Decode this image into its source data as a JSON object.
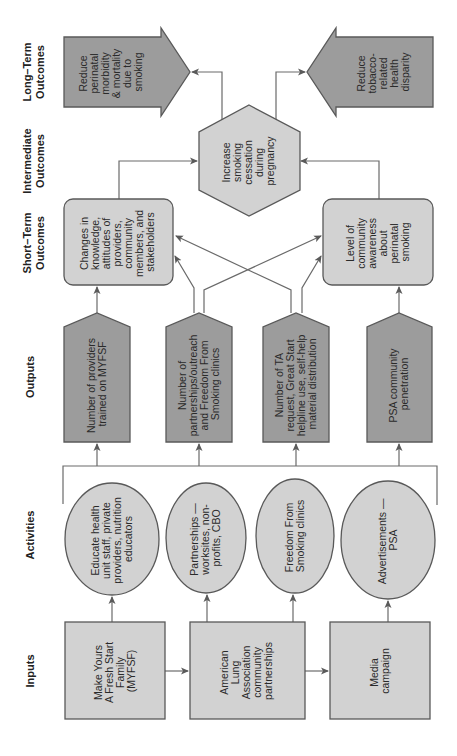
{
  "columns": {
    "long_term": [
      "Long–Term",
      "Outcomes"
    ],
    "intermediate": [
      "Intermediate",
      "Outcomes"
    ],
    "short_term": [
      "Short–Term",
      "Outcomes"
    ],
    "outputs": [
      "Outputs"
    ],
    "activities": [
      "Activities"
    ],
    "inputs": [
      "Inputs"
    ]
  },
  "long_term_outcomes": [
    {
      "lines": [
        "Reduce",
        "perinatal",
        "morbidity",
        "& mortality",
        "due to",
        "smoking"
      ]
    },
    {
      "lines": [
        "Reduce",
        "tobacco-",
        "related",
        "health",
        "disparity"
      ]
    }
  ],
  "intermediate_outcome": {
    "lines": [
      "Increase",
      "smoking",
      "cessation",
      "during",
      "pregnancy"
    ]
  },
  "short_term_outcomes": [
    {
      "lines": [
        "Changes in",
        "knowledge,",
        "attitudes of",
        "providers,",
        "community",
        "members, and",
        "stakeholders"
      ]
    },
    {
      "lines": [
        "Level of",
        "community",
        "awareness",
        "about",
        "perinatal",
        "smoking"
      ]
    }
  ],
  "outputs": [
    {
      "lines": [
        "Number of providers",
        "trained on MYFSF"
      ]
    },
    {
      "lines": [
        "Number of",
        "partnerships/outreach",
        "and Freedom From",
        "Smoking clinics"
      ]
    },
    {
      "lines": [
        "Number of TA",
        "request, Great Start",
        "helpline use, self-help",
        "material distribution"
      ]
    },
    {
      "lines": [
        "PSA community",
        "penetration"
      ]
    }
  ],
  "activities": [
    {
      "lines": [
        "Educate health",
        "unit staff, private",
        "providers, nutrition",
        "educators"
      ]
    },
    {
      "lines": [
        "Partnerships —",
        "worksites, non-",
        "profits, CBO"
      ]
    },
    {
      "lines": [
        "Freedom From",
        "Smoking clinics"
      ]
    },
    {
      "lines": [
        "Advertisements —",
        "PSA"
      ]
    }
  ],
  "inputs": [
    {
      "lines": [
        "Make Yours",
        "A Fresh Start",
        "Family",
        "(MYFSF)"
      ]
    },
    {
      "lines": [
        "American",
        "Lung",
        "Association",
        "community",
        "partnerships"
      ]
    },
    {
      "lines": [
        "Media",
        "campaign"
      ]
    }
  ],
  "colors": {
    "dark_fill": "#9c9c9c",
    "light_fill": "#d2d2d2",
    "stroke": "#595959"
  }
}
